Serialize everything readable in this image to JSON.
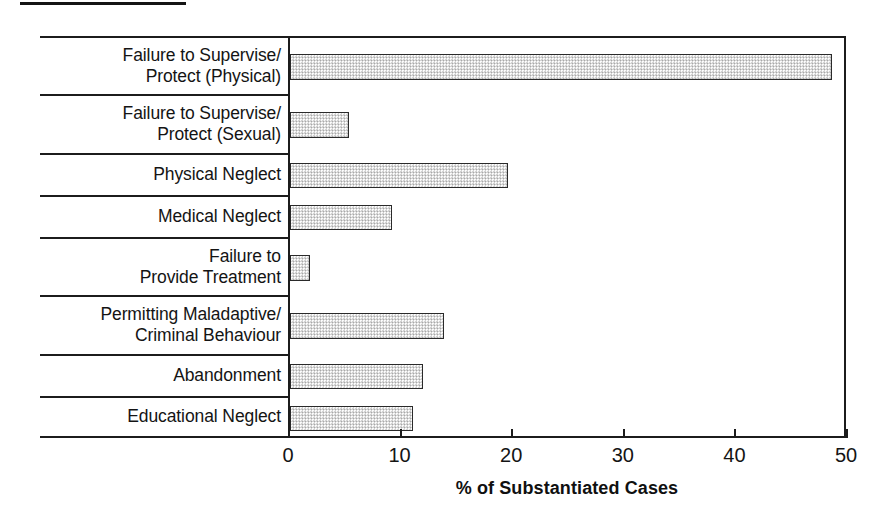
{
  "figure": {
    "top_rule": "rule",
    "background": "#ffffff",
    "bar_fill": "#d2d2d2",
    "bar_stroke": "#2a2a2a",
    "axis_color": "#1c1c1c"
  },
  "chart_data": {
    "type": "bar",
    "orientation": "horizontal",
    "title": "",
    "xlabel": "% of Substantiated Cases",
    "ylabel": "",
    "xlim": [
      0,
      50
    ],
    "xticks": [
      0,
      10,
      20,
      30,
      40,
      50
    ],
    "xtick_labels": [
      "0",
      "10",
      "20",
      "30",
      "40",
      "50"
    ],
    "grid": false,
    "legend": false,
    "categories": [
      "Failure to Supervise/\nProtect (Physical)",
      "Failure to Supervise/\nProtect (Sexual)",
      "Physical Neglect",
      "Medical Neglect",
      "Failure to\nProvide Treatment",
      "Permitting Maladaptive/\nCriminal Behaviour",
      "Abandonment",
      "Educational Neglect"
    ],
    "values": [
      48.6,
      5.3,
      19.5,
      9.1,
      1.8,
      13.8,
      11.9,
      11.0
    ]
  }
}
